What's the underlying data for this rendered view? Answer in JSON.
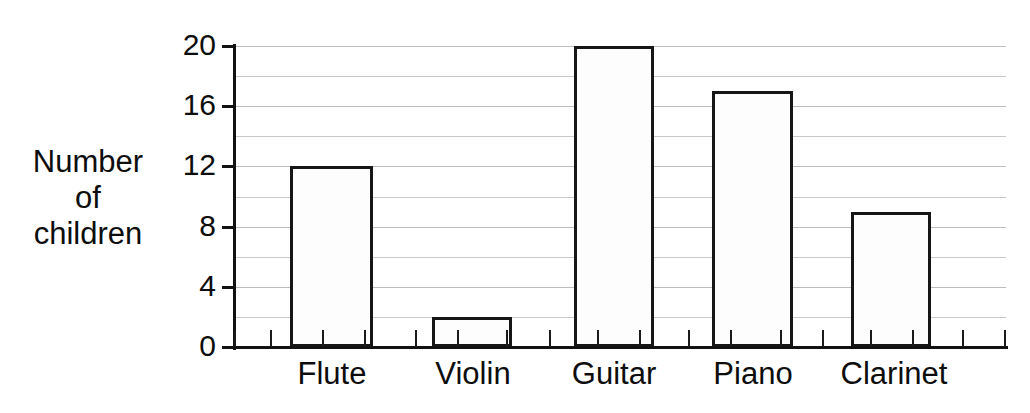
{
  "chart_data": {
    "type": "bar",
    "title": "",
    "subtitle": "",
    "xlabel": "",
    "ylabel": "Number of children",
    "ylabel_lines": [
      "Number",
      "of",
      "children"
    ],
    "categories": [
      "Flute",
      "Violin",
      "Guitar",
      "Piano",
      "Clarinet"
    ],
    "values": [
      12,
      2,
      20,
      17,
      9
    ],
    "ylim": [
      0,
      20
    ],
    "ytick_labels": [
      "0",
      "4",
      "8",
      "12",
      "16",
      "20"
    ],
    "ytick_values": [
      0,
      4,
      8,
      12,
      16,
      20
    ],
    "gridline_values": [
      2,
      4,
      6,
      8,
      10,
      12,
      14,
      16,
      18,
      20
    ],
    "grid": true,
    "legend": "none",
    "colors": {
      "bar_fill": "#fdfdfd",
      "bar_outline": "#161616",
      "gridline": "#c9c9c9",
      "axis": "#121212",
      "text": "#0d0d0d",
      "background": "#ffffff"
    }
  },
  "axis": {
    "y_title_lines": [
      "Number",
      "of",
      "children"
    ],
    "y_ticks": [
      {
        "label": "20",
        "value": 20
      },
      {
        "label": "16",
        "value": 16
      },
      {
        "label": "12",
        "value": 12
      },
      {
        "label": "8",
        "value": 8
      },
      {
        "label": "4",
        "value": 4
      },
      {
        "label": "0",
        "value": 0
      }
    ],
    "x_categories": [
      {
        "label": "Flute",
        "value": 12
      },
      {
        "label": "Violin",
        "value": 2
      },
      {
        "label": "Guitar",
        "value": 20
      },
      {
        "label": "Piano",
        "value": 17
      },
      {
        "label": "Clarinet",
        "value": 9
      }
    ]
  }
}
